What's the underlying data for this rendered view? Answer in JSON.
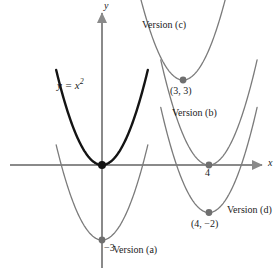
{
  "figure": {
    "top_caption": "",
    "axis_x_label": "x",
    "axis_y_label": "y",
    "base_curve_label_y": "y",
    "base_curve_label_eq": " = x",
    "base_curve_label_exp": "2",
    "colors": {
      "base_curve": "#141414",
      "transformed_curve": "#7b7b7b",
      "axis": "#8a8a8a",
      "point_base": "#1a1a1a",
      "point_transformed": "#6f6f6f",
      "text": "#1b1b1b",
      "background": "#ffffff"
    }
  },
  "labels": {
    "version_a": "Version (a)",
    "version_b": "Version (b)",
    "version_c": "Version (c)",
    "version_d": "Version (d)",
    "point_3_3": "(3, 3)",
    "point_4_neg2": "(4, −2)",
    "tick_four": "4",
    "tick_neg_three": "−3"
  },
  "chart_data": {
    "type": "line",
    "title": "",
    "xlabel": "x",
    "ylabel": "y",
    "grid": false,
    "legend": "inline-annotations",
    "xlim": [
      -4.2,
      6.6
    ],
    "ylim": [
      -5.2,
      6.2
    ],
    "origin_px": [
      102,
      165
    ],
    "px_per_unit": [
      23.5,
      25.0
    ],
    "series": [
      {
        "name": "y = x^2",
        "label": "y = x²",
        "color": "#141414",
        "width": 2.4,
        "vertex": [
          0,
          0
        ],
        "a": 1,
        "vertex_point_label": "",
        "x_range": [
          -1.95,
          1.95
        ]
      },
      {
        "name": "Version (a)",
        "label": "Version (a)",
        "color": "#7b7b7b",
        "width": 1.3,
        "vertex": [
          0,
          -3
        ],
        "a": 1,
        "vertex_point_label": "−3",
        "x_range": [
          -1.95,
          1.95
        ]
      },
      {
        "name": "Version (b)",
        "label": "Version (b)",
        "color": "#7b7b7b",
        "width": 1.3,
        "vertex": [
          4.55,
          0
        ],
        "a": 1,
        "vertex_point_label": "4",
        "x_range": [
          -2.05,
          2.05
        ]
      },
      {
        "name": "Version (c)",
        "label": "Version (c)",
        "color": "#7b7b7b",
        "width": 1.3,
        "vertex": [
          3.45,
          3.4
        ],
        "a": 1,
        "vertex_point_label": "(3, 3)",
        "x_range": [
          -2.05,
          2.05
        ]
      },
      {
        "name": "Version (d)",
        "label": "Version (d)",
        "color": "#7b7b7b",
        "width": 1.3,
        "vertex": [
          4.55,
          -1.9
        ],
        "a": 1,
        "vertex_point_label": "(4, −2)",
        "x_range": [
          -2.05,
          2.05
        ]
      }
    ],
    "annotations": [
      {
        "text": "Version (c)",
        "at": [
          1.7,
          5.8
        ]
      },
      {
        "text": "(3, 3)",
        "at": [
          2.9,
          2.4
        ]
      },
      {
        "text": "Version (b)",
        "at": [
          3.0,
          1.5
        ]
      },
      {
        "text": "4",
        "at": [
          4.4,
          -0.4
        ]
      },
      {
        "text": "(4, −2)",
        "at": [
          3.8,
          -2.6
        ]
      },
      {
        "text": "Version (d)",
        "at": [
          5.3,
          -1.9
        ]
      },
      {
        "text": "Version (a)",
        "at": [
          0.5,
          -3.6
        ]
      },
      {
        "text": "−3",
        "at": [
          0.1,
          -3.4
        ]
      },
      {
        "text": "y = x²",
        "at": [
          -1.9,
          3.3
        ]
      }
    ]
  }
}
